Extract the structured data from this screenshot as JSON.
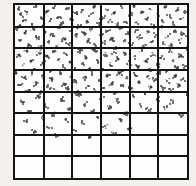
{
  "figure": {
    "title": "",
    "caption": "",
    "background_color": "#f2f1ef",
    "plot_background_color": "#fdfdfd",
    "grid_color": "#15140f",
    "point_color": "#4a4a4a"
  },
  "chart_data": {
    "type": "scatter",
    "title": "",
    "subtitle": "",
    "xlabel": "",
    "ylabel": "",
    "xlim": [
      0,
      6
    ],
    "ylim": [
      0,
      8
    ],
    "grid": true,
    "legend": null,
    "annotations": [],
    "xticks": [
      0,
      1,
      2,
      3,
      4,
      5,
      6
    ],
    "yticks": [
      0,
      1,
      2,
      3,
      4,
      5,
      6,
      7,
      8
    ],
    "xtick_labels": [
      "",
      "",
      "",
      "",
      "",
      "",
      ""
    ],
    "ytick_labels": [
      "",
      "",
      "",
      "",
      "",
      "",
      "",
      "",
      ""
    ],
    "quadrat_grid": {
      "columns": 6,
      "rows": 8,
      "line_width_px": 2
    },
    "series": [
      {
        "name": "points",
        "marker": "point",
        "color": "#4a4a4a",
        "n": 214,
        "x": [
          0.1,
          0.22,
          0.31,
          0.16,
          0.42,
          0.58,
          0.72,
          0.88,
          0.95,
          1.08,
          1.21,
          1.35,
          1.48,
          1.62,
          1.77,
          1.9,
          2.05,
          2.18,
          2.31,
          2.44,
          2.58,
          2.71,
          2.85,
          2.97,
          3.1,
          3.24,
          3.38,
          3.51,
          3.65,
          3.78,
          3.92,
          4.05,
          4.19,
          4.32,
          4.46,
          4.59,
          4.73,
          4.86,
          5.0,
          5.13,
          5.27,
          5.4,
          5.54,
          5.67,
          5.81,
          5.94,
          0.07,
          0.19,
          0.34,
          0.47,
          0.61,
          0.74,
          0.88,
          1.01,
          1.15,
          1.28,
          1.42,
          1.55,
          1.69,
          1.82,
          1.96,
          2.09,
          2.23,
          2.36,
          2.5,
          2.63,
          2.77,
          2.9,
          3.04,
          3.17,
          3.31,
          3.44,
          3.58,
          3.71,
          3.85,
          3.98,
          4.12,
          4.25,
          4.39,
          4.52,
          4.66,
          4.79,
          4.93,
          5.06,
          5.2,
          5.33,
          5.47,
          5.6,
          5.74,
          5.87,
          0.13,
          0.27,
          0.4,
          0.54,
          0.67,
          0.81,
          0.94,
          1.08,
          1.21,
          1.35,
          1.48,
          1.62,
          1.75,
          1.89,
          2.02,
          2.16,
          2.29,
          2.43,
          2.56,
          2.7,
          2.83,
          2.97,
          3.1,
          3.24,
          3.37,
          3.51,
          3.64,
          3.78,
          3.91,
          4.05,
          4.18,
          4.32,
          4.45,
          4.59,
          4.72,
          4.86,
          4.99,
          5.13,
          5.26,
          5.4,
          5.53,
          5.67,
          5.8,
          5.94,
          0.05,
          0.18,
          0.32,
          0.45,
          0.59,
          0.72,
          0.86,
          0.99,
          1.13,
          1.26,
          1.4,
          1.53,
          1.67,
          1.8,
          1.94,
          2.07,
          2.21,
          2.34,
          2.48,
          2.61,
          2.75,
          2.88,
          3.02,
          3.15,
          3.29,
          3.42,
          3.56,
          3.69,
          3.83,
          3.96,
          4.1,
          4.23,
          4.37,
          4.5,
          4.64,
          4.77,
          4.91,
          5.04,
          5.18,
          5.31,
          5.45,
          5.58,
          5.72,
          5.85,
          5.99,
          0.24,
          0.51,
          0.78,
          1.05,
          1.32,
          1.59,
          1.86,
          2.13,
          2.4,
          2.67,
          2.94,
          3.21,
          3.48,
          3.75,
          4.02,
          4.29,
          4.56,
          4.83,
          5.1,
          5.37,
          5.64,
          5.91,
          0.38,
          0.65,
          0.92,
          1.19,
          1.46,
          1.73,
          2.0,
          2.27,
          2.54,
          2.81,
          3.08,
          3.35,
          3.62,
          3.89
        ],
        "y": [
          7.82,
          7.55,
          7.31,
          7.04,
          7.68,
          7.12,
          7.9,
          7.4,
          7.05,
          7.72,
          7.28,
          7.95,
          7.48,
          7.18,
          7.85,
          7.36,
          7.62,
          7.02,
          7.76,
          7.25,
          7.58,
          7.93,
          7.1,
          7.44,
          7.81,
          7.3,
          7.66,
          7.08,
          7.88,
          7.21,
          7.53,
          7.97,
          7.15,
          7.7,
          7.39,
          7.84,
          7.06,
          7.61,
          7.27,
          7.92,
          7.46,
          7.13,
          7.79,
          7.35,
          7.64,
          7.01,
          6.88,
          6.42,
          6.75,
          6.19,
          6.93,
          6.51,
          6.07,
          6.8,
          6.34,
          6.68,
          6.12,
          6.97,
          6.45,
          6.23,
          6.85,
          6.58,
          6.01,
          6.72,
          6.38,
          6.9,
          6.15,
          6.63,
          6.29,
          6.81,
          6.47,
          6.05,
          6.94,
          6.36,
          6.7,
          6.21,
          6.86,
          6.53,
          6.1,
          6.77,
          6.31,
          6.64,
          6.98,
          6.25,
          6.59,
          6.13,
          6.82,
          6.4,
          6.68,
          6.04,
          5.75,
          5.28,
          5.91,
          5.46,
          5.13,
          5.82,
          5.37,
          5.69,
          5.05,
          5.94,
          5.51,
          5.22,
          5.78,
          5.41,
          5.08,
          5.86,
          5.33,
          5.62,
          5.17,
          5.97,
          5.44,
          5.1,
          5.73,
          5.29,
          5.88,
          5.55,
          5.02,
          5.8,
          5.36,
          5.65,
          5.19,
          5.93,
          5.48,
          5.11,
          5.76,
          5.31,
          5.61,
          5.06,
          5.89,
          5.43,
          5.15,
          5.71,
          5.25,
          5.84,
          4.92,
          4.38,
          4.71,
          4.15,
          4.87,
          4.43,
          4.09,
          4.76,
          4.3,
          4.64,
          4.18,
          4.95,
          4.41,
          4.22,
          4.83,
          4.55,
          4.03,
          4.69,
          4.35,
          4.88,
          4.12,
          4.6,
          4.26,
          4.79,
          4.45,
          4.01,
          4.91,
          4.33,
          4.67,
          4.2,
          4.84,
          4.5,
          4.07,
          4.74,
          4.28,
          4.62,
          4.96,
          4.23,
          4.56,
          4.11,
          4.8,
          4.37,
          4.65,
          4.02,
          4.48,
          3.62,
          3.15,
          3.88,
          3.41,
          3.07,
          3.74,
          3.29,
          3.95,
          3.52,
          3.18,
          3.81,
          3.36,
          3.68,
          3.11,
          3.9,
          3.45,
          3.24,
          3.77,
          3.33,
          3.59,
          3.02,
          3.85,
          2.71,
          2.28,
          2.93,
          2.46,
          2.13,
          2.82,
          2.37,
          2.69,
          2.05,
          2.94,
          2.51,
          2.22,
          2.78,
          2.41
        ]
      }
    ]
  },
  "grid_lines": {
    "vertical_fractions": [
      0.1667,
      0.3333,
      0.5,
      0.6667,
      0.8333
    ],
    "horizontal_fractions": [
      0.125,
      0.25,
      0.375,
      0.5,
      0.625,
      0.75,
      0.875
    ]
  }
}
